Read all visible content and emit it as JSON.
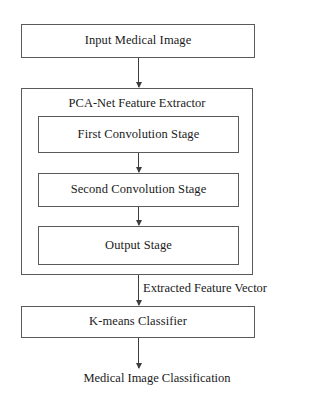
{
  "diagram": {
    "background_color": "#ffffff",
    "box_border_color": "#5a5a5a",
    "arrow_color": "#3d3d3d",
    "text_color": "#1a1a1a",
    "nodes": {
      "input": {
        "label": "Input Medical Image"
      },
      "pcanet": {
        "label": "PCA-Net Feature Extractor"
      },
      "first_conv": {
        "label": "First Convolution Stage"
      },
      "second_conv": {
        "label": "Second Convolution Stage"
      },
      "output_stage": {
        "label": "Output Stage"
      },
      "kmeans": {
        "label": "K-means Classifier"
      },
      "result": {
        "label": "Medical Image Classification"
      }
    },
    "edge_labels": {
      "extracted_feature_vector": "Extracted Feature Vector"
    }
  }
}
